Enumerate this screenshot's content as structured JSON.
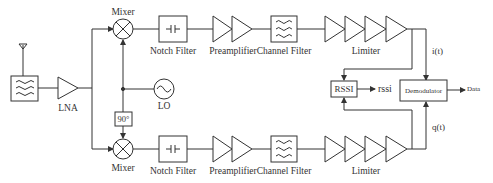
{
  "diagram": {
    "type": "block-diagram",
    "title": "",
    "blocks": {
      "antenna": "",
      "rf_filter": "",
      "lna": "LNA",
      "mixer_i": "Mixer",
      "mixer_q": "Mixer",
      "lo": "LO",
      "phase_shift": "90°",
      "notch_filter_i": "Notch Filter",
      "notch_filter_q": "Notch Filter",
      "preamplifier_i": "Preamplifier",
      "preamplifier_q": "Preamplifier",
      "channel_filter_i": "Channel Filter",
      "channel_filter_q": "Channel Filter",
      "limiter_i": "Limiter",
      "limiter_q": "Limiter",
      "rssi": "RSSI",
      "demodulator": "Demodulator"
    },
    "signals": {
      "i": "i(t)",
      "q": "q(t)",
      "rssi_out": "rssi",
      "data_out": "Data"
    },
    "colors": {
      "stroke": "#333333",
      "background": "#ffffff"
    }
  }
}
